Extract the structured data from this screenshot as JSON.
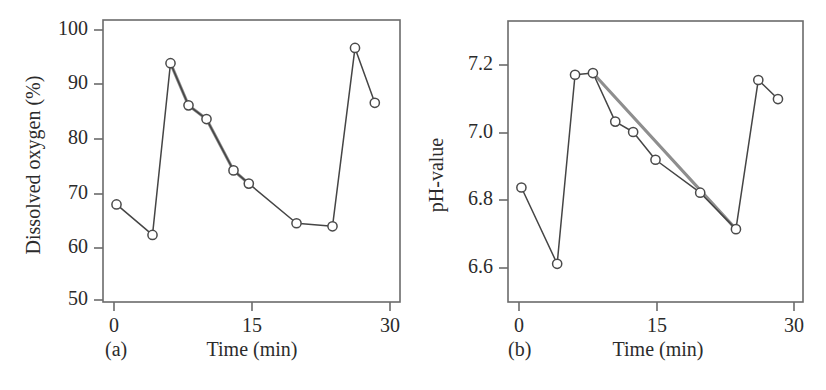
{
  "figure": {
    "background": "#ffffff",
    "line_color": "#454545",
    "trend_color": "#8e8e8e",
    "marker_fill": "#ffffff",
    "marker_stroke": "#4a4a4a",
    "axis_color": "#6b6b6b",
    "text_color": "#2b2b2b"
  },
  "panels": [
    {
      "tag": "(a)",
      "tag_name": "panel-a",
      "xlabel": "Time (min)",
      "ylabel": "Dissolved oxygen (%)",
      "xticks": [
        "0",
        "15",
        "30"
      ],
      "yticks": [
        "100",
        "90",
        "80",
        "70",
        "60",
        "50"
      ]
    },
    {
      "tag": "(b)",
      "tag_name": "panel-b",
      "xlabel": "Time (min)",
      "ylabel": "pH-value",
      "xticks": [
        "0",
        "15",
        "30"
      ],
      "yticks": [
        "7.2",
        "7.0",
        "6.8",
        "6.6"
      ]
    }
  ],
  "chart_data": [
    {
      "type": "line",
      "panel": "(a)",
      "title": "",
      "xlabel": "Time (min)",
      "ylabel": "Dissolved oxygen (%)",
      "xlim": [
        -1.5,
        31.5
      ],
      "ylim": [
        47.0,
        102.5
      ],
      "xticks": [
        0,
        15,
        30
      ],
      "yticks": [
        100,
        90,
        80,
        70,
        60,
        50
      ],
      "grid": false,
      "legend": "none",
      "series": [
        {
          "name": "Dissolved oxygen measurements",
          "style": "line-with-open-circle-markers",
          "color": "#454545",
          "x": [
            0,
            4,
            6,
            8,
            10,
            13,
            14.7,
            20,
            24,
            26.5,
            28.7
          ],
          "y": [
            66.2,
            60.2,
            94.0,
            85.7,
            83.0,
            72.9,
            70.3,
            62.5,
            61.9,
            97.0,
            86.2
          ]
        },
        {
          "name": "Linear decay trend",
          "style": "thick-gray-straight-line",
          "color": "#8e8e8e",
          "x": [
            6,
            8,
            10,
            13,
            14.7
          ],
          "y": [
            94.0,
            85.7,
            83.0,
            72.9,
            70.3
          ]
        }
      ]
    },
    {
      "type": "line",
      "panel": "(b)",
      "title": "",
      "xlabel": "Time (min)",
      "ylabel": "pH-value",
      "xlim": [
        -1.5,
        31.5
      ],
      "ylim": [
        6.48,
        7.29
      ],
      "xticks": [
        0,
        15,
        30
      ],
      "yticks": [
        7.2,
        7.0,
        6.8,
        6.6
      ],
      "grid": false,
      "legend": "none",
      "series": [
        {
          "name": "pH measurements",
          "style": "line-with-open-circle-markers",
          "color": "#454545",
          "x": [
            0,
            4,
            6,
            8,
            10.5,
            12.5,
            15,
            20,
            24,
            26.5,
            28.7
          ],
          "y": [
            6.81,
            6.59,
            7.135,
            7.14,
            7.0,
            6.97,
            6.89,
            6.795,
            6.69,
            7.12,
            7.065
          ]
        },
        {
          "name": "Linear decay trend",
          "style": "thick-gray-straight-line",
          "color": "#8e8e8e",
          "x": [
            8,
            24
          ],
          "y": [
            7.14,
            6.69
          ]
        }
      ]
    }
  ]
}
